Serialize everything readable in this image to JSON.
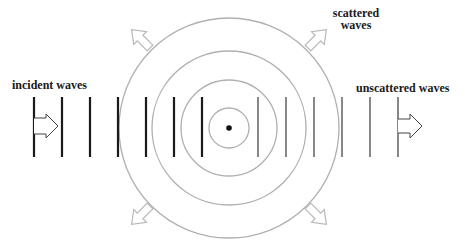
{
  "labels": {
    "incident": "incident waves",
    "unscattered": "unscattered waves",
    "scattered_line1": "scattered",
    "scattered_line2": "waves"
  },
  "colors": {
    "background": "#ffffff",
    "incident_lines": "#1a1a1a",
    "unscattered_lines": "#555555",
    "circles": "#b0b0b0",
    "arrows_outline": "#b8b8b8",
    "scatterer_dot": "#111111",
    "text": "#1a1a1a"
  },
  "geometry": {
    "center": {
      "x": 229,
      "y": 128
    },
    "circle_radii": [
      20,
      48,
      77,
      110
    ],
    "incident_line_x": [
      34,
      62,
      90,
      118,
      146,
      174,
      202
    ],
    "unscattered_line_x": [
      258,
      286,
      314,
      342,
      370,
      398
    ],
    "line_y_top": 97,
    "line_y_bottom": 157
  },
  "icons": {
    "incident_arrow": "right-arrow-outline",
    "unscattered_arrow": "right-arrow-outline",
    "scattered_arrows": [
      "up-left-arrow-outline",
      "up-right-arrow-outline",
      "down-left-arrow-outline",
      "down-right-arrow-outline"
    ],
    "scatterer": "dot"
  }
}
